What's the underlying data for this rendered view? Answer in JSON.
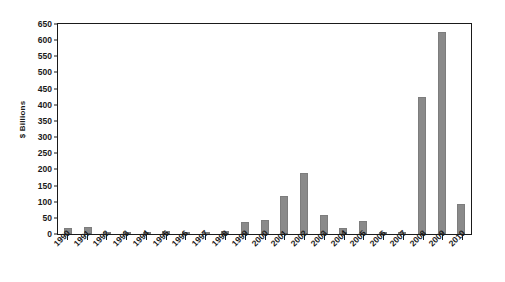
{
  "chart_data": {
    "type": "bar",
    "title": "",
    "subtitle": "",
    "xlabel": "",
    "ylabel": "$ Billions",
    "ylim": [
      0,
      650
    ],
    "ytick_step": 50,
    "yticks": [
      650,
      600,
      550,
      500,
      450,
      400,
      350,
      300,
      250,
      200,
      150,
      100,
      50,
      0
    ],
    "grid": false,
    "legend": null,
    "legend_position": "none",
    "bar_color": "#8a8a8a",
    "axis_color": "#1a1a1a",
    "background": "#ffffff",
    "categories": [
      "1990",
      "1991",
      "1992",
      "1993",
      "1994",
      "1995",
      "1996",
      "1997",
      "1998",
      "1999",
      "2000",
      "2001",
      "2002",
      "2003",
      "2004",
      "2005",
      "2006",
      "2007",
      "2008",
      "2009",
      "2010"
    ],
    "values": [
      19,
      21,
      3,
      0,
      0,
      8,
      0,
      2,
      9,
      38,
      42,
      117,
      190,
      60,
      18,
      39,
      3,
      3,
      425,
      625,
      93
    ],
    "series": [
      {
        "name": "$ Billions",
        "values": [
          19,
          21,
          3,
          0,
          0,
          8,
          0,
          2,
          9,
          38,
          42,
          117,
          190,
          60,
          18,
          39,
          3,
          3,
          425,
          625,
          93
        ]
      }
    ],
    "annotations": []
  }
}
